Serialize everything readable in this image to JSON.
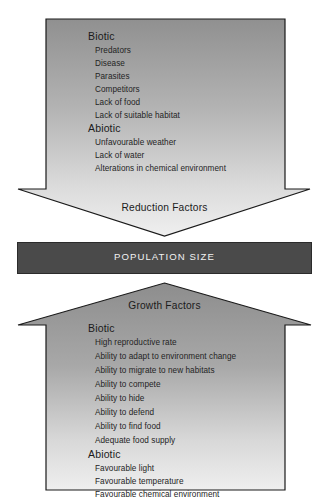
{
  "diagram": {
    "colors": {
      "arrow_fill_top": "#8f8f8f",
      "arrow_fill_bottom": "#ececec",
      "arrow_stroke": "#1a1a1a",
      "bar_fill": "#4a4a4a",
      "bar_stroke": "#2b2b2b",
      "bar_text": "#f2f2f2",
      "body_text": "#242424",
      "background": "#ffffff"
    },
    "reduction_arrow": {
      "caption": "Reduction Factors",
      "direction": "down",
      "groups": [
        {
          "heading": "Biotic",
          "items": [
            "Predators",
            "Disease",
            "Parasites",
            "Competitors",
            "Lack of food",
            "Lack of suitable habitat"
          ]
        },
        {
          "heading": "Abiotic",
          "items": [
            "Unfavourable weather",
            "Lack of water",
            "Alterations in chemical environment"
          ]
        }
      ]
    },
    "population_bar": {
      "label": "POPULATION SIZE"
    },
    "growth_arrow": {
      "caption": "Growth Factors",
      "direction": "up",
      "groups": [
        {
          "heading": "Biotic",
          "items": [
            "High reproductive rate",
            "Ability to adapt to environment change",
            "Ability to migrate to new habitats",
            "Ability to compete",
            "Ability to hide",
            "Ability to defend",
            "Ability to find food",
            "Adequate food supply"
          ]
        },
        {
          "heading": "Abiotic",
          "items": [
            "Favourable light",
            "Favourable temperature",
            "Favourable chemical environment"
          ]
        }
      ]
    }
  }
}
